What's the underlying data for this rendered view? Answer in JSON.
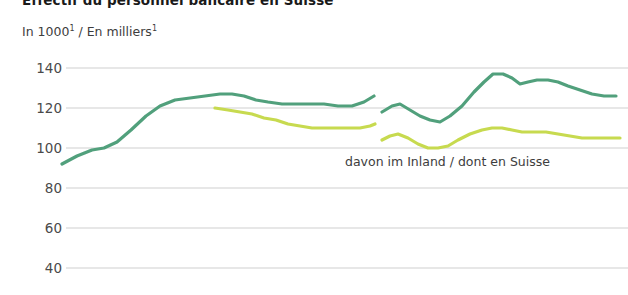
{
  "chart_data": {
    "type": "line",
    "title": "Effectif du personnel bancaire en Suisse",
    "subtitle": "In 1000¹ / En milliers¹",
    "unit_prefix": "In 1000",
    "unit_suffix": "/ En milliers",
    "unit_footnote": "1",
    "ylabel": "",
    "xlabel": "",
    "ylim": [
      40,
      145
    ],
    "yticks": [
      140,
      120,
      100,
      80,
      60,
      40
    ],
    "ytick_labels": [
      "140",
      "120",
      "100",
      "80",
      "60",
      "40"
    ],
    "grid": true,
    "grid_axis": "y",
    "legend_position": "inline-right",
    "annotations": [
      {
        "text": "davon im Inland / dont en Suisse",
        "x": 345,
        "y": 154
      }
    ],
    "series": [
      {
        "name": "Total / Gesamt",
        "color": "#51a07c",
        "segments": [
          {
            "break_after": true,
            "points": [
              [
                62,
                92
              ],
              [
                77,
                96
              ],
              [
                92,
                99
              ],
              [
                104,
                100
              ],
              [
                117,
                103
              ],
              [
                131,
                109
              ],
              [
                146,
                116
              ],
              [
                160,
                121
              ],
              [
                175,
                124
              ],
              [
                190,
                125
              ],
              [
                205,
                126
              ],
              [
                220,
                127
              ],
              [
                232,
                127
              ],
              [
                244,
                126
              ],
              [
                256,
                124
              ],
              [
                268,
                123
              ],
              [
                282,
                122
              ],
              [
                296,
                122
              ],
              [
                310,
                122
              ],
              [
                324,
                122
              ],
              [
                338,
                121
              ],
              [
                352,
                121
              ],
              [
                364,
                123
              ],
              [
                374,
                126
              ]
            ]
          },
          {
            "break_before": true,
            "points": [
              [
                382,
                118
              ],
              [
                392,
                121
              ],
              [
                400,
                122
              ],
              [
                410,
                119
              ],
              [
                420,
                116
              ],
              [
                430,
                114
              ],
              [
                440,
                113
              ],
              [
                450,
                116
              ],
              [
                462,
                121
              ],
              [
                474,
                128
              ],
              [
                484,
                133
              ],
              [
                493,
                137
              ],
              [
                503,
                137
              ],
              [
                512,
                135
              ],
              [
                520,
                132
              ],
              [
                528,
                133
              ],
              [
                537,
                134
              ],
              [
                548,
                134
              ],
              [
                558,
                133
              ],
              [
                568,
                131
              ],
              [
                580,
                129
              ],
              [
                592,
                127
              ],
              [
                604,
                126
              ],
              [
                616,
                126
              ]
            ]
          }
        ]
      },
      {
        "name": "davon im Inland / dont en Suisse",
        "color": "#c7da4f",
        "segments": [
          {
            "break_after": true,
            "points": [
              [
                215,
                120
              ],
              [
                228,
                119
              ],
              [
                240,
                118
              ],
              [
                252,
                117
              ],
              [
                264,
                115
              ],
              [
                276,
                114
              ],
              [
                288,
                112
              ],
              [
                300,
                111
              ],
              [
                312,
                110
              ],
              [
                324,
                110
              ],
              [
                336,
                110
              ],
              [
                348,
                110
              ],
              [
                360,
                110
              ],
              [
                370,
                111
              ],
              [
                375,
                112
              ]
            ]
          },
          {
            "break_before": true,
            "points": [
              [
                382,
                104
              ],
              [
                390,
                106
              ],
              [
                398,
                107
              ],
              [
                408,
                105
              ],
              [
                418,
                102
              ],
              [
                428,
                100
              ],
              [
                438,
                100
              ],
              [
                448,
                101
              ],
              [
                458,
                104
              ],
              [
                470,
                107
              ],
              [
                482,
                109
              ],
              [
                492,
                110
              ],
              [
                502,
                110
              ],
              [
                512,
                109
              ],
              [
                522,
                108
              ],
              [
                534,
                108
              ],
              [
                546,
                108
              ],
              [
                558,
                107
              ],
              [
                570,
                106
              ],
              [
                582,
                105
              ],
              [
                596,
                105
              ],
              [
                610,
                105
              ],
              [
                620,
                105
              ]
            ]
          }
        ]
      }
    ]
  }
}
